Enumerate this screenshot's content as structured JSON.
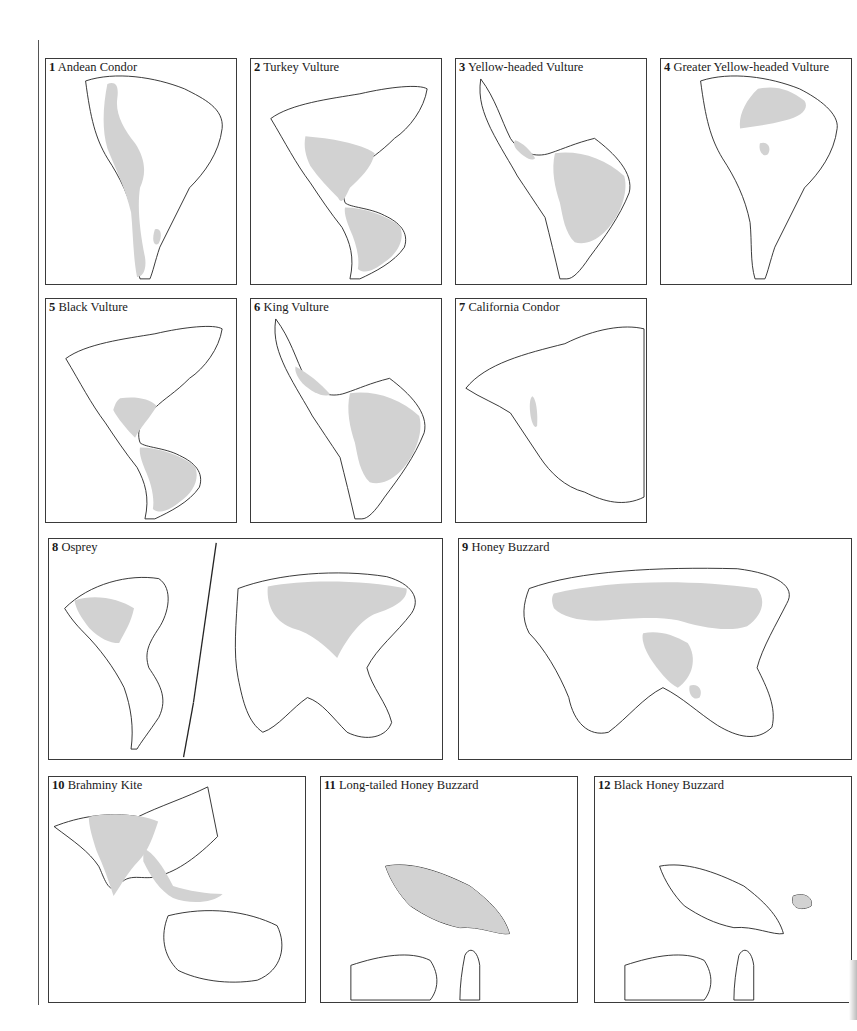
{
  "page": {
    "range_fill_color": "#d2d2d2",
    "outline_color": "#222222"
  },
  "maps": [
    {
      "number": "1",
      "name": "Andean Condor",
      "region": "South America"
    },
    {
      "number": "2",
      "name": "Turkey Vulture",
      "region": "North and South America"
    },
    {
      "number": "3",
      "name": "Yellow-headed Vulture",
      "region": "Central and South America"
    },
    {
      "number": "4",
      "name": "Greater Yellow-headed Vulture",
      "region": "South America"
    },
    {
      "number": "5",
      "name": "Black Vulture",
      "region": "North and South America"
    },
    {
      "number": "6",
      "name": "King Vulture",
      "region": "Central and South America"
    },
    {
      "number": "7",
      "name": "California Condor",
      "region": "North America"
    },
    {
      "number": "8",
      "name": "Osprey",
      "region": "World"
    },
    {
      "number": "9",
      "name": "Honey Buzzard",
      "region": "Old World"
    },
    {
      "number": "10",
      "name": "Brahminy Kite",
      "region": "South Asia to Australia"
    },
    {
      "number": "11",
      "name": "Long-tailed Honey Buzzard",
      "region": "New Guinea"
    },
    {
      "number": "12",
      "name": "Black Honey Buzzard",
      "region": "New Guinea"
    }
  ]
}
